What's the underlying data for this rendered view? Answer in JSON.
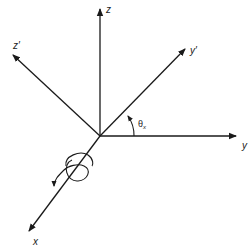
{
  "diagram": {
    "colors": {
      "stroke": "#1a1a1a",
      "background": "#ffffff"
    },
    "origin": {
      "x": 100,
      "y": 136
    },
    "axes": [
      {
        "id": "z",
        "label": "z",
        "end": {
          "x": 100,
          "y": 8
        },
        "label_pos": {
          "x": 106,
          "y": 13
        }
      },
      {
        "id": "z-prime",
        "label": "z′",
        "end": {
          "x": 12,
          "y": 55
        },
        "label_pos": {
          "x": 13,
          "y": 49
        }
      },
      {
        "id": "y-prime",
        "label": "y′",
        "end": {
          "x": 186,
          "y": 48
        },
        "label_pos": {
          "x": 190,
          "y": 54
        }
      },
      {
        "id": "y",
        "label": "y",
        "end": {
          "x": 237,
          "y": 136
        },
        "label_pos": {
          "x": 242,
          "y": 149
        }
      },
      {
        "id": "x",
        "label": "x",
        "end": {
          "x": 28,
          "y": 232
        },
        "label_pos": {
          "x": 33,
          "y": 245
        }
      }
    ],
    "angle": {
      "symbol": "θ",
      "subscript": "x",
      "label_pos": {
        "x": 138,
        "y": 127
      }
    },
    "rotation_indicator": {
      "about_axis": "x",
      "center": {
        "x": 77,
        "y": 170
      }
    }
  }
}
